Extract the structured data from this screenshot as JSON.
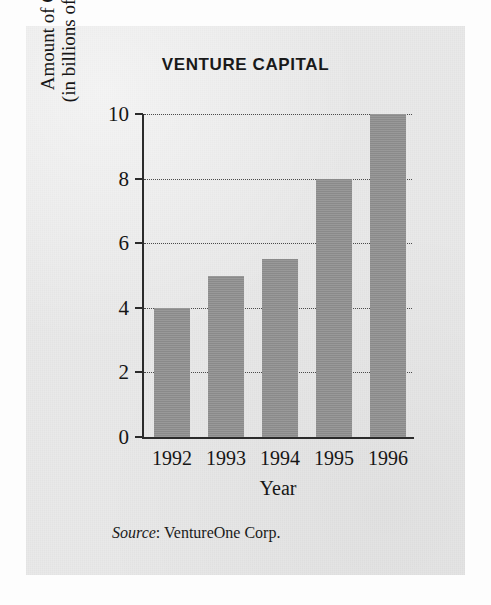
{
  "figure": {
    "background_color": "#e9e9e9",
    "page_color": "#fdfdfd"
  },
  "source_note": {
    "label": "Source",
    "separator": ": ",
    "text": "VentureOne Corp."
  },
  "chart_data": {
    "type": "bar",
    "title": "VENTURE CAPITAL",
    "xlabel": "Year",
    "ylabel": "Amount of Capital\n(in billions of dollars)",
    "ylabel_line1": "Amount of Capital",
    "ylabel_line2": "(in billions of dollars)",
    "categories": [
      "1992",
      "1993",
      "1994",
      "1995",
      "1996"
    ],
    "values": [
      4,
      5,
      5.5,
      8,
      10
    ],
    "series": [
      {
        "name": "Amount of Capital",
        "values": [
          4,
          5,
          5.5,
          8,
          10
        ]
      }
    ],
    "ylim": [
      0,
      10
    ],
    "xlim_categories": 5,
    "yticks": [
      0,
      2,
      4,
      6,
      8,
      10
    ],
    "ytick_labels": [
      "0",
      "2",
      "4",
      "6",
      "8",
      "10"
    ],
    "grid": true,
    "grid_style": "dotted",
    "grid_axis": "y",
    "legend": null,
    "legend_position": "none",
    "bar_color": "#919191",
    "axis_color": "#2b2b2b",
    "units": "billions of dollars"
  }
}
